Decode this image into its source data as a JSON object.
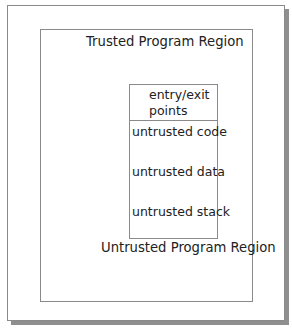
{
  "diagram": {
    "outer_label": "Trusted Program Region",
    "inner_label": "Untrusted Program Region",
    "stack_box": {
      "entry_line1": "entry/exit",
      "entry_line2": "points",
      "rows": [
        "untrusted code",
        "untrusted data",
        "untrusted stack"
      ]
    }
  }
}
